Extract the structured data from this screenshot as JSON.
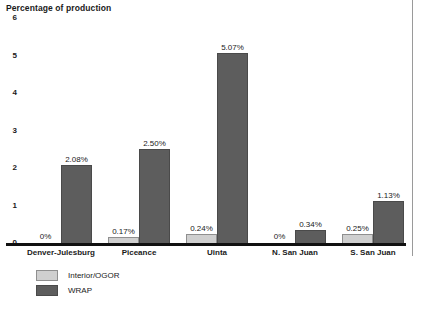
{
  "chart_data": {
    "type": "bar",
    "title": "Percentage of production",
    "xlabel": "",
    "ylabel": "Percentage of production",
    "ylim": [
      0,
      6
    ],
    "yticks": [
      "0",
      "1",
      "2",
      "3",
      "4",
      "5",
      "6"
    ],
    "grid": false,
    "legend_position": "below-left",
    "categories": [
      "Denver-Julesburg",
      "Piceance",
      "Uinta",
      "N. San Juan",
      "S. San Juan"
    ],
    "series": [
      {
        "name": "Interior/OGOR",
        "color": "#cfcfcf",
        "values": [
          0,
          0.17,
          0.24,
          0,
          0.25
        ],
        "labels": [
          "0%",
          "0.17%",
          "0.24%",
          "0%",
          "0.25%"
        ]
      },
      {
        "name": "WRAP",
        "color": "#5d5d5d",
        "values": [
          2.08,
          2.5,
          5.07,
          0.34,
          1.13
        ],
        "labels": [
          "2.08%",
          "2.50%",
          "5.07%",
          "0.34%",
          "1.13%"
        ]
      }
    ]
  },
  "caption": {
    "text": ""
  }
}
